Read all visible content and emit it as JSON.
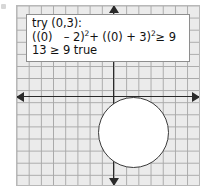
{
  "figure": {
    "type": "coordinate-plane-inequality-check",
    "background_color": "#ffffff",
    "grid_color": "#a8a8a8",
    "plane_fill": "#ebebeb",
    "axis_color": "#2a2a2a",
    "circle_stroke": "#3a3a3a",
    "circle_fill": "#ffffff"
  },
  "work_box": {
    "border_color": "#8e8e8e",
    "background": "#ffffff",
    "line1": "try (0,3):",
    "line2_part1": "((0)",
    "line2_minus": "– 2)",
    "line2_exp1": "2",
    "line2_plus": "+ ((0) + 3)",
    "line2_exp2": "2",
    "line2_tail": "≥ 9",
    "line3": "13 ≥ 9 true"
  },
  "axes": {
    "x_axis_label": "x-axis",
    "y_axis_label": "y-axis",
    "left_arrow": "arrow-left",
    "right_arrow": "arrow-right",
    "up_arrow": "arrow-up",
    "down_arrow": "arrow-down"
  },
  "chart_data": {
    "type": "scatter",
    "title": "",
    "xlabel": "",
    "ylabel": "",
    "grid": true,
    "legend": null,
    "grid_spacing": 1,
    "shapes": [
      {
        "kind": "circle",
        "center_x": 3,
        "center_y": -2,
        "radius": 3,
        "stroke": "#3a3a3a",
        "fill": "#ffffff",
        "dashed": false,
        "equation": "(x - 2)^2 + (y + 3)^2 = 9"
      }
    ],
    "annotations": [
      "try (0,3):",
      "((0) - 2)^2 + ((0) + 3)^2 >= 9",
      "13 >= 9 true"
    ],
    "test_point": {
      "x": 0,
      "y": 3,
      "result": "true",
      "lhs": 13,
      "rhs": 9
    }
  }
}
